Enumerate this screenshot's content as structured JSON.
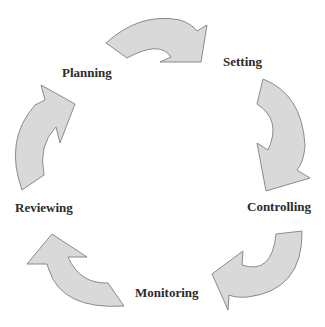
{
  "diagram": {
    "type": "cycle",
    "colors": {
      "arrow_fill": "#d9d9d9",
      "arrow_stroke": "#7f7f7f",
      "label_text": "#2b2b2b",
      "background": "#ffffff"
    },
    "stages": [
      {
        "id": "planning",
        "label": "Planning"
      },
      {
        "id": "setting",
        "label": "Setting"
      },
      {
        "id": "controlling",
        "label": "Controlling"
      },
      {
        "id": "monitoring",
        "label": "Monitoring"
      },
      {
        "id": "reviewing",
        "label": "Reviewing"
      }
    ],
    "connections": [
      {
        "from": "Planning",
        "to": "Setting"
      },
      {
        "from": "Setting",
        "to": "Controlling"
      },
      {
        "from": "Controlling",
        "to": "Monitoring"
      },
      {
        "from": "Monitoring",
        "to": "Reviewing"
      },
      {
        "from": "Reviewing",
        "to": "Planning"
      }
    ]
  }
}
